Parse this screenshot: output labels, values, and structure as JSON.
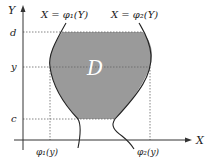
{
  "diagram": {
    "type": "region-between-curves",
    "axes": {
      "x_label": "X",
      "y_label": "Y"
    },
    "curves": {
      "left_label": "X = φ₁(Y)",
      "right_label": "X = φ₂(Y)"
    },
    "y_ticks": {
      "d": "d",
      "y": "y",
      "c": "c"
    },
    "x_ticks": {
      "phi1": "φ₁(y)",
      "phi2": "φ₂(y)"
    },
    "region_label": "D",
    "colors": {
      "region_fill": "#9a9a9a",
      "curve_stroke": "#222222",
      "axis_stroke": "#333333",
      "dotted_stroke": "#888888"
    }
  }
}
